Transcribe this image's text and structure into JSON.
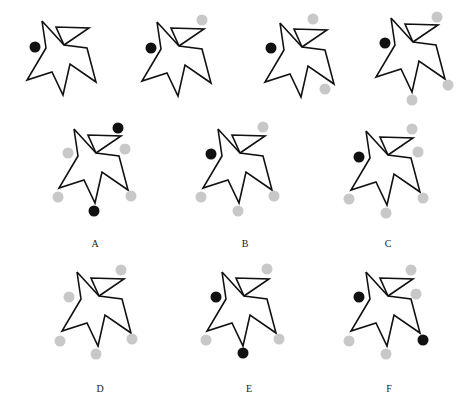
{
  "figure": {
    "width": 469,
    "height": 409,
    "colors": {
      "outline": "#111111",
      "dot_black": "#111111",
      "dot_gray": "#c8c8c8",
      "label": "#222222"
    },
    "dot_radius": 5.5,
    "base_shape": {
      "description": "star-like polygon with a triangular flap; coordinates relative to the top point",
      "outline": [
        [
          0,
          0
        ],
        [
          4,
          27
        ],
        [
          -15,
          59
        ],
        [
          10,
          51
        ],
        [
          21,
          74
        ],
        [
          28,
          43
        ],
        [
          54,
          61
        ],
        [
          45,
          27
        ],
        [
          22,
          24
        ],
        [
          0,
          0
        ]
      ],
      "flap": [
        [
          22,
          24
        ],
        [
          14,
          6
        ],
        [
          47,
          7
        ],
        [
          22,
          24
        ]
      ]
    },
    "panels": [
      {
        "id": "top-1",
        "label": "",
        "origin": [
          42,
          21
        ],
        "dots": [
          {
            "x": 35,
            "y": 47,
            "color": "black"
          }
        ]
      },
      {
        "id": "top-2",
        "label": "",
        "origin": [
          157,
          22
        ],
        "dots": [
          {
            "x": 151,
            "y": 48,
            "color": "black"
          },
          {
            "x": 202,
            "y": 20,
            "color": "gray"
          }
        ]
      },
      {
        "id": "top-3",
        "label": "",
        "origin": [
          280,
          23
        ],
        "dots": [
          {
            "x": 271,
            "y": 48,
            "color": "black"
          },
          {
            "x": 313,
            "y": 19,
            "color": "gray"
          },
          {
            "x": 325,
            "y": 89,
            "color": "gray"
          }
        ]
      },
      {
        "id": "top-4",
        "label": "",
        "origin": [
          391,
          18
        ],
        "dots": [
          {
            "x": 385,
            "y": 43,
            "color": "black"
          },
          {
            "x": 437,
            "y": 17,
            "color": "gray"
          },
          {
            "x": 448,
            "y": 85,
            "color": "gray"
          },
          {
            "x": 412,
            "y": 100,
            "color": "gray"
          }
        ]
      },
      {
        "id": "A",
        "label": "A",
        "origin": [
          74,
          129
        ],
        "label_pos": [
          95,
          247
        ],
        "dots": [
          {
            "x": 118,
            "y": 128,
            "color": "black"
          },
          {
            "x": 68,
            "y": 153,
            "color": "gray"
          },
          {
            "x": 125,
            "y": 149,
            "color": "gray"
          },
          {
            "x": 58,
            "y": 197,
            "color": "gray"
          },
          {
            "x": 131,
            "y": 196,
            "color": "gray"
          },
          {
            "x": 94,
            "y": 211,
            "color": "black"
          }
        ]
      },
      {
        "id": "B",
        "label": "B",
        "origin": [
          218,
          129
        ],
        "label_pos": [
          245,
          247
        ],
        "dots": [
          {
            "x": 211,
            "y": 154,
            "color": "black"
          },
          {
            "x": 263,
            "y": 127,
            "color": "gray"
          },
          {
            "x": 201,
            "y": 197,
            "color": "gray"
          },
          {
            "x": 274,
            "y": 196,
            "color": "gray"
          },
          {
            "x": 238,
            "y": 211,
            "color": "gray"
          }
        ]
      },
      {
        "id": "C",
        "label": "C",
        "origin": [
          366,
          131
        ],
        "label_pos": [
          388,
          247
        ],
        "dots": [
          {
            "x": 359,
            "y": 157,
            "color": "black"
          },
          {
            "x": 412,
            "y": 129,
            "color": "gray"
          },
          {
            "x": 418,
            "y": 152,
            "color": "gray"
          },
          {
            "x": 349,
            "y": 199,
            "color": "gray"
          },
          {
            "x": 423,
            "y": 198,
            "color": "gray"
          },
          {
            "x": 386,
            "y": 213,
            "color": "gray"
          }
        ]
      },
      {
        "id": "D",
        "label": "D",
        "origin": [
          77,
          272
        ],
        "label_pos": [
          100,
          392
        ],
        "dots": [
          {
            "x": 121,
            "y": 270,
            "color": "gray"
          },
          {
            "x": 69,
            "y": 297,
            "color": "gray"
          },
          {
            "x": 60,
            "y": 341,
            "color": "gray"
          },
          {
            "x": 132,
            "y": 339,
            "color": "gray"
          },
          {
            "x": 96,
            "y": 354,
            "color": "gray"
          }
        ]
      },
      {
        "id": "E",
        "label": "E",
        "origin": [
          222,
          272
        ],
        "label_pos": [
          249,
          392
        ],
        "dots": [
          {
            "x": 267,
            "y": 269,
            "color": "gray"
          },
          {
            "x": 216,
            "y": 297,
            "color": "black"
          },
          {
            "x": 206,
            "y": 340,
            "color": "gray"
          },
          {
            "x": 279,
            "y": 339,
            "color": "gray"
          },
          {
            "x": 243,
            "y": 353,
            "color": "black"
          }
        ]
      },
      {
        "id": "F",
        "label": "F",
        "origin": [
          366,
          272
        ],
        "label_pos": [
          389,
          392
        ],
        "dots": [
          {
            "x": 411,
            "y": 270,
            "color": "gray"
          },
          {
            "x": 416,
            "y": 294,
            "color": "gray"
          },
          {
            "x": 359,
            "y": 297,
            "color": "black"
          },
          {
            "x": 349,
            "y": 341,
            "color": "gray"
          },
          {
            "x": 423,
            "y": 340,
            "color": "black"
          },
          {
            "x": 386,
            "y": 354,
            "color": "gray"
          }
        ]
      }
    ]
  }
}
